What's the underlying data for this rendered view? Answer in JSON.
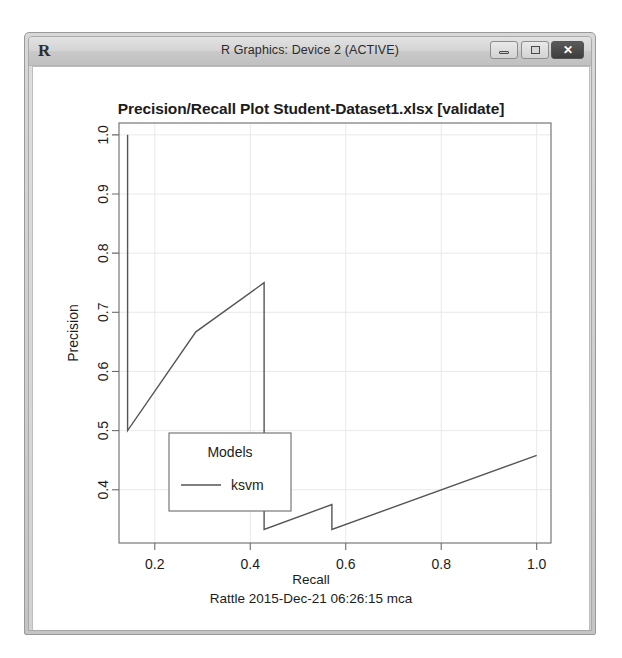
{
  "window": {
    "app_logo": "R",
    "title": "R Graphics: Device 2 (ACTIVE)",
    "buttons": {
      "minimize": "minimize",
      "maximize": "maximize",
      "close": "✕"
    }
  },
  "chart_data": {
    "type": "line",
    "title": "Precision/Recall Plot  Student-Dataset1.xlsx [validate]",
    "xlabel": "Recall",
    "ylabel": "Precision",
    "subtitle": "Rattle 2015-Dec-21 06:26:15 mca",
    "xlim": [
      0.125,
      1.03
    ],
    "ylim": [
      0.31,
      1.02
    ],
    "xticks": [
      "0.2",
      "0.4",
      "0.6",
      "0.8",
      "1.0"
    ],
    "xtick_values": [
      0.2,
      0.4,
      0.6,
      0.8,
      1.0
    ],
    "yticks": [
      "0.4",
      "0.5",
      "0.6",
      "0.7",
      "0.8",
      "0.9",
      "1.0"
    ],
    "ytick_values": [
      0.4,
      0.5,
      0.6,
      0.7,
      0.8,
      0.9,
      1.0
    ],
    "grid": true,
    "legend": {
      "title": "Models",
      "position": "bottom-left",
      "entries": [
        {
          "label": "ksvm",
          "color": "#555555"
        }
      ]
    },
    "series": [
      {
        "name": "ksvm",
        "color": "#555555",
        "points": [
          [
            0.143,
            1.0
          ],
          [
            0.143,
            0.5
          ],
          [
            0.286,
            0.667
          ],
          [
            0.429,
            0.75
          ],
          [
            0.429,
            0.333
          ],
          [
            0.571,
            0.375
          ],
          [
            0.571,
            0.333
          ],
          [
            1.0,
            0.458
          ]
        ]
      }
    ]
  }
}
